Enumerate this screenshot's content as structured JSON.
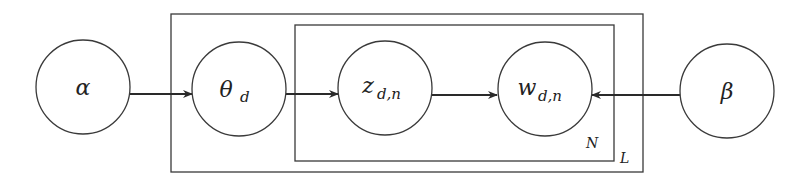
{
  "diagram": {
    "type": "plate-notation",
    "plates": [
      {
        "id": "outer",
        "label": "L",
        "x": 171,
        "y": 14,
        "w": 472,
        "h": 158
      },
      {
        "id": "inner",
        "label": "N",
        "x": 295,
        "y": 25,
        "w": 319,
        "h": 136
      }
    ],
    "nodes": [
      {
        "id": "alpha",
        "symbol": "α",
        "subscript": "",
        "cx": 83,
        "cy": 87
      },
      {
        "id": "theta",
        "symbol": "θ",
        "subscript": "d",
        "cx": 239,
        "cy": 89
      },
      {
        "id": "z",
        "symbol": "z",
        "subscript": "d,n",
        "cx": 385,
        "cy": 88
      },
      {
        "id": "w",
        "symbol": "w",
        "subscript": "d,n",
        "cx": 545,
        "cy": 89
      },
      {
        "id": "beta",
        "symbol": "β",
        "subscript": "",
        "cx": 727,
        "cy": 91
      }
    ],
    "edges": [
      {
        "from": "alpha",
        "to": "theta"
      },
      {
        "from": "theta",
        "to": "z"
      },
      {
        "from": "z",
        "to": "w"
      },
      {
        "from": "beta",
        "to": "w"
      }
    ]
  }
}
